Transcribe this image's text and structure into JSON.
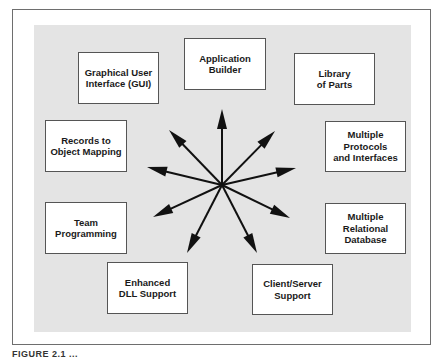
{
  "diagram": {
    "hub": {
      "center": [
        222,
        185
      ]
    },
    "boxes": [
      {
        "id": "gui",
        "label": "Graphical User\nInterface (GUI)",
        "rect": [
          78,
          52,
          81,
          52
        ]
      },
      {
        "id": "app-builder",
        "label": "Application\nBuilder",
        "rect": [
          184,
          38,
          82,
          52
        ]
      },
      {
        "id": "library",
        "label": "Library\nof Parts",
        "rect": [
          294,
          53,
          81,
          52
        ]
      },
      {
        "id": "records",
        "label": "Records to\nObject Mapping",
        "rect": [
          45,
          120,
          82,
          52
        ]
      },
      {
        "id": "protocols",
        "label": "Multiple\nProtocols\nand Interfaces",
        "rect": [
          325,
          121,
          81,
          51
        ]
      },
      {
        "id": "team",
        "label": "Team\nProgramming",
        "rect": [
          45,
          202,
          82,
          52
        ]
      },
      {
        "id": "relational",
        "label": "Multiple\nRelational\nDatabase",
        "rect": [
          325,
          203,
          81,
          51
        ]
      },
      {
        "id": "dll",
        "label": "Enhanced\nDLL Support",
        "rect": [
          107,
          262,
          81,
          52
        ]
      },
      {
        "id": "client-server",
        "label": "Client/Server\nSupport",
        "rect": [
          252,
          264,
          81,
          51
        ]
      }
    ],
    "arrows": [
      {
        "to": "up",
        "tip": [
          222,
          109
        ]
      },
      {
        "to": "upper-left",
        "tip": [
          169,
          130
        ]
      },
      {
        "to": "upper-right",
        "tip": [
          275,
          131
        ]
      },
      {
        "to": "left",
        "tip": [
          147,
          167
        ]
      },
      {
        "to": "right",
        "tip": [
          296,
          168
        ]
      },
      {
        "to": "lower-left",
        "tip": [
          153,
          217
        ]
      },
      {
        "to": "lower-right",
        "tip": [
          290,
          218
        ]
      },
      {
        "to": "down-left",
        "tip": [
          187,
          253
        ]
      },
      {
        "to": "down-right",
        "tip": [
          257,
          253
        ]
      }
    ],
    "colors": {
      "panel": "#e4e4e4",
      "arrow": "#111111",
      "border": "#555555"
    }
  },
  "caption": {
    "text": "FIGURE 2.1 ..."
  }
}
